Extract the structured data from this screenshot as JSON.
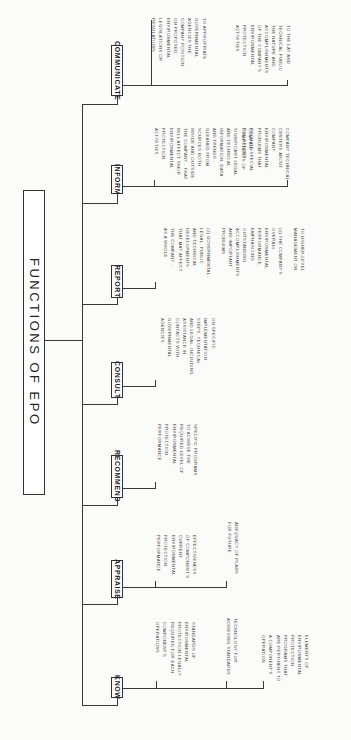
{
  "title": "FUNCTIONS OF EPO",
  "functions": [
    {
      "label": "COMMUNICATE",
      "items": [
        "TO APPROPRIATE\nGOVERNMENTAL\nAGENCIES THE\nCOMPANY POSITION\nON PROPOSED\nENVIRONMENTAL\nLEGISLATIONS OR\nREGULATIONS",
        "TO THE LAY AND\nTECHNICAL PUBLIC\nTHE NATURE AND\nACCOMPLISHMENTS\nOF THE COMPANY'S\nENVIRONMENTAL\nPROTECTION\nACTIVITIES"
      ]
    },
    {
      "label": "INFORM",
      "items": [
        "COMPANY\nCOMPONENTS OF\nSIGNIFICANT LEGAL\nAND TECHNICAL\nINFORMATION, DATA\nAND TRENDS -\nGLEANED FROM\nSOURCES BOTH\nINSIDE AND OUTSIDE\nTHE COMPANY - THAT\nWILL AFFECT THEIR\nENVIRONMENTAL\nPROTECTION\nACTIVITIES",
        "COMPANY TECHNICAL\nCENTERS ABOUT\nCOMPANY\nENVIRONMENTAL\nPROBLEMS THAT\nREQUIRE SPECIAL\nR&D EFFORT"
      ]
    },
    {
      "label": "REPORT",
      "items": [
        "TO HIGHER-LEVEL\nMANAGEMENT ON:\n\n(1) THE COMPANY'S\nOVERALL\nENVIRONMENTAL\nPERFORMANCE,\nEMPHASIZING\nOUTSTANDING\nACCOMPLISHMENTS\nAND IMPORTANT\nPROBLEMS\n\n(2) GOVERNMENTAL,\nLEGAL, PUBLIC\nAND TECHNICAL\nDEVELOPMENTS\nTHAT MAY AFFECT\nTHE COMPANY -\nAS A WHOLE"
      ]
    },
    {
      "label": "CONSULT",
      "items": [
        "ON SPECIFIC\nIMPLEMENTATION\nSTEPS, TECHNICAL\nAND LEGAL, INCLUDING\nASSISTANCE IN\nCONTACTS WITH\nGOVERNMENTAL\nAGENCIES"
      ]
    },
    {
      "label": "RECOMMEND",
      "items": [
        "SPECIFIC PROGRAMS\nTO ACHIEVE THE\nREQUIRED LEVEL OF\nENVIRONMENTAL\nPROTECTION\nPERFORMANCE"
      ]
    },
    {
      "label": "APPRAISE",
      "items": [
        "EFFECTIVENESS\nOF COMPONENT'S\nCURRENT\nENVIRONMENTAL\nPROTECTION\nPERFORMANCE",
        "ADEQUACY OF PLANS\nFOR FUTURE"
      ]
    },
    {
      "label": "KNOW",
      "items": [
        "STANDARDS OF\nENVIRONMENTAL\nPROTECTION LEGALLY\nREQUIRED FOR EACH\nCOMPONENT'S\nOPERATIONS",
        "TECHNOLOGY FOR\nACHIEVING STANDARDS",
        "ELEMENTS OF\nENVIRONMENTAL\nPROTECTION\nPROGRAMS THAT\nARE PERTINENT TO\nA COMPONENT'S\nOPERATION"
      ]
    }
  ]
}
